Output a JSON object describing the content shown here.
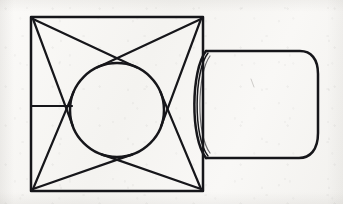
{
  "image": {
    "title": "Hand-drawn orthographic sketch of a square flange with circular boss and attached cylinder",
    "medium": "pencil line drawing on textured paper",
    "width": 343,
    "height": 204,
    "background_color": "#f7f6f4",
    "ink_color": "#16161a"
  },
  "shapes": {
    "square_flange": {
      "name": "square plate (front view)",
      "left": 31,
      "top": 17,
      "right": 203,
      "bottom": 191,
      "stroke_color": "#16161a",
      "stroke_width": 2.5
    },
    "inscribed_circle": {
      "name": "circular boss inscribed in square",
      "center_x": 117,
      "center_y": 110,
      "radius": 47,
      "stroke_color": "#16161a",
      "stroke_width": 2.5
    },
    "corner_diagonals": {
      "name": "tangent lines from square corners to circle",
      "description": "eight straight lines, two from each corner, tangent to the inscribed circle forming a four-pointed star",
      "count": 8,
      "stroke_width": 2.2
    },
    "left_tick": {
      "name": "short horizontal construction line on left edge",
      "x1": 31,
      "y1": 106,
      "x2": 72,
      "y2": 106,
      "stroke_width": 2.2
    },
    "cylinder": {
      "name": "cylinder / boss projecting to the right (side view)",
      "near_rim_x": 205,
      "top_y": 51,
      "bottom_y": 158,
      "right_cap_x": 318,
      "rim_bulge": 14,
      "stroke_width": 2.5,
      "has_double_rim_arc": true
    }
  },
  "annotations": {
    "labels": [],
    "dimensions": [],
    "text": ""
  }
}
